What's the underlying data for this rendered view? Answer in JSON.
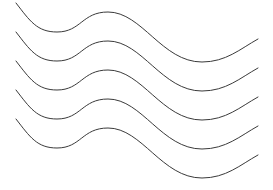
{
  "figure": {
    "background": "#ffffff",
    "stroke_color": "#3a3a3a",
    "stroke_width": 1,
    "wave_count": 5,
    "vertical_spacing": 29,
    "base_path": {
      "start": [
        16,
        3
      ],
      "trough_1": [
        57,
        32
      ],
      "peak_1": [
        108,
        12
      ],
      "trough_2": [
        202,
        62
      ],
      "end": [
        258,
        39
      ]
    },
    "offsets_y": [
      0,
      29,
      58,
      87,
      116
    ]
  }
}
